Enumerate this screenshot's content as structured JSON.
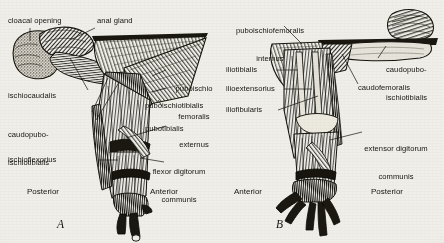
{
  "figure": {
    "background_color": "#efeee9",
    "ink_color": "#171510",
    "panels": [
      {
        "letter": "A",
        "orientation_left": "Posterior",
        "orientation_right": "Anterior",
        "labels": [
          {
            "id": "cloacal-opening",
            "text": "cloacal opening"
          },
          {
            "id": "anal-gland",
            "text": "anal gland"
          },
          {
            "id": "puboischio-femoralis-externus",
            "text": "puboischio\nfemoralis\nexternus"
          },
          {
            "id": "puboischiotibialis",
            "text": "puboischiotibialis"
          },
          {
            "id": "pubotibialis",
            "text": "pubotibialis"
          },
          {
            "id": "flexor-digitorum-communis",
            "text": "flexor digitorum\ncommunis"
          },
          {
            "id": "ischiocaudalis",
            "text": "ischiocaudalis"
          },
          {
            "id": "caudopubo-ischiotibialis",
            "text": "caudopubo-\nischiotibialis"
          },
          {
            "id": "ischioflexorius",
            "text": "ischioflexorius"
          }
        ]
      },
      {
        "letter": "B",
        "orientation_left": "Anterior",
        "orientation_right": "Posterior",
        "labels": [
          {
            "id": "puboischiofemoralis-internus",
            "text": "puboischiofemoralis\ninternus"
          },
          {
            "id": "caudopubo-ischiotibialis",
            "text": "caudopubo-\nischiotibialis"
          },
          {
            "id": "caudofemoralis",
            "text": "caudofemoralis"
          },
          {
            "id": "iliotibialis",
            "text": "iliotibialis"
          },
          {
            "id": "ilioextensorius",
            "text": "ilioextensorius"
          },
          {
            "id": "iliofibularis",
            "text": "iliofibularis"
          },
          {
            "id": "extensor-digitorum-communis",
            "text": "extensor digitorum\ncommunis"
          }
        ]
      }
    ]
  },
  "labels_a": {
    "cloacal_opening": "cloacal opening",
    "anal_gland": "anal gland",
    "puboischio_femoralis_externus_l1": "puboischio",
    "puboischio_femoralis_externus_l2": "femoralis",
    "puboischio_femoralis_externus_l3": "externus",
    "puboischiotibialis": "puboischiotibialis",
    "pubotibialis": "pubotibialis",
    "flexor_digitorum_communis_l1": "flexor digitorum",
    "flexor_digitorum_communis_l2": "communis",
    "ischiocaudalis": "ischiocaudalis",
    "caudopubo_ischiotibialis_l1": "caudopubo-",
    "caudopubo_ischiotibialis_l2": "ischiotibialis",
    "ischioflexorius": "ischioflexorius",
    "posterior": "Posterior",
    "anterior": "Anterior",
    "letter": "A"
  },
  "labels_b": {
    "puboischiofemoralis_internus_l1": "puboischiofemoralis",
    "puboischiofemoralis_internus_l2": "internus",
    "caudopubo_ischiotibialis_l1": "caudopubo-",
    "caudopubo_ischiotibialis_l2": "ischiotibialis",
    "caudofemoralis": "caudofemoralis",
    "iliotibialis": "iliotibialis",
    "ilioextensorius": "ilioextensorius",
    "iliofibularis": "iliofibularis",
    "extensor_digitorum_communis_l1": "extensor digitorum",
    "extensor_digitorum_communis_l2": "communis",
    "anterior": "Anterior",
    "posterior": "Posterior",
    "letter": "B"
  }
}
